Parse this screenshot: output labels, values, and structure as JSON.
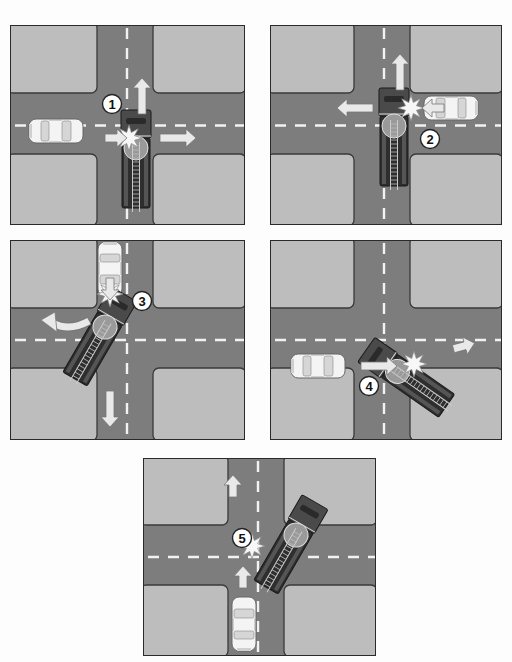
{
  "diagram": {
    "title": "",
    "colors": {
      "road": "#7d7d7d",
      "block": "#bdbdbd",
      "block_border": "#3a3a3a",
      "lane_dash": "#f2f2f2",
      "car_body": "#f4f4f4",
      "truck_body": "#4a4a4a",
      "truck_dark": "#2e2e2e",
      "arrow": "#e9e9e9",
      "impact": "#f7f7f7",
      "label_bg": "#ffffff",
      "label_text": "#111111"
    },
    "panels": [
      {
        "id": 1,
        "label": "1",
        "box": {
          "x": 10,
          "y": 25,
          "w": 235,
          "h": 200
        },
        "road": {
          "vx": 86,
          "vw": 60,
          "hy": 67,
          "hh": 65
        },
        "label_pos": {
          "x": 101,
          "y": 78
        },
        "car": {
          "x": 45,
          "y": 105,
          "angle": 0,
          "desc": "car heading east"
        },
        "truck": {
          "x": 125,
          "y": 130,
          "angle": 0,
          "desc": "fire truck heading north"
        },
        "impact": {
          "x": 118,
          "y": 112
        },
        "arrows": [
          {
            "desc": "truck direction north",
            "x": 131,
            "y": 70,
            "angle": -90
          },
          {
            "desc": "car direction east",
            "x": 105,
            "y": 112,
            "angle": 0,
            "short": true
          },
          {
            "desc": "truck pushed east",
            "x": 167,
            "y": 112,
            "angle": 0
          }
        ]
      },
      {
        "id": 2,
        "label": "2",
        "box": {
          "x": 270,
          "y": 25,
          "w": 232,
          "h": 200
        },
        "road": {
          "vx": 83,
          "vw": 60,
          "hy": 67,
          "hh": 65
        },
        "label_pos": {
          "x": 159,
          "y": 113
        },
        "car": {
          "x": 180,
          "y": 82,
          "angle": 180,
          "desc": "car heading west"
        },
        "truck": {
          "x": 123,
          "y": 108,
          "angle": 0,
          "desc": "fire truck heading north"
        },
        "impact": {
          "x": 140,
          "y": 82
        },
        "arrows": [
          {
            "desc": "truck direction north",
            "x": 129,
            "y": 46,
            "angle": -90
          },
          {
            "desc": "car direction west",
            "x": 162,
            "y": 82,
            "angle": 180,
            "short": true
          },
          {
            "desc": "truck pushed west",
            "x": 84,
            "y": 82,
            "angle": 180
          }
        ]
      },
      {
        "id": 3,
        "label": "3",
        "box": {
          "x": 10,
          "y": 240,
          "w": 235,
          "h": 200
        },
        "road": {
          "vx": 86,
          "vw": 60,
          "hy": 67,
          "hh": 64
        },
        "label_pos": {
          "x": 131,
          "y": 60
        },
        "car": {
          "x": 99,
          "y": 28,
          "angle": 90,
          "desc": "car heading south"
        },
        "truck": {
          "x": 90,
          "y": 93,
          "angle": 30,
          "desc": "fire truck turning northwest"
        },
        "impact": {
          "x": 99,
          "y": 53
        },
        "arrows": [
          {
            "desc": "truck curved northwest",
            "x": 48,
            "y": 85,
            "angle": 200,
            "curved": true
          },
          {
            "desc": "car direction south",
            "x": 99,
            "y": 48,
            "angle": 90,
            "short": true
          },
          {
            "desc": "truck pushed south",
            "x": 99,
            "y": 168,
            "angle": 90
          }
        ]
      },
      {
        "id": 4,
        "label": "4",
        "box": {
          "x": 270,
          "y": 240,
          "w": 232,
          "h": 200
        },
        "road": {
          "vx": 83,
          "vw": 60,
          "hy": 67,
          "hh": 64
        },
        "label_pos": {
          "x": 98,
          "y": 145
        },
        "car": {
          "x": 47,
          "y": 125,
          "angle": 0,
          "desc": "car heading east"
        },
        "truck": {
          "x": 133,
          "y": 135,
          "angle": -55,
          "desc": "fire truck heading northeast"
        },
        "impact": {
          "x": 143,
          "y": 123
        },
        "arrows": [
          {
            "desc": "car direction east",
            "x": 108,
            "y": 125,
            "angle": 0
          },
          {
            "desc": "truck pushed east",
            "x": 193,
            "y": 105,
            "angle": -15,
            "short": true
          }
        ]
      },
      {
        "id": 5,
        "label": "5",
        "box": {
          "x": 143,
          "y": 458,
          "w": 233,
          "h": 198
        },
        "road": {
          "vx": 84,
          "vw": 60,
          "hy": 66,
          "hh": 64
        },
        "label_pos": {
          "x": 98,
          "y": 79
        },
        "car": {
          "x": 100,
          "y": 165,
          "angle": -90,
          "desc": "car heading north"
        },
        "truck": {
          "x": 148,
          "y": 83,
          "angle": 30,
          "desc": "fire truck heading northwest"
        },
        "impact": {
          "x": 108,
          "y": 87
        },
        "arrows": [
          {
            "desc": "truck pushed north",
            "x": 89,
            "y": 27,
            "angle": -90,
            "short": true
          },
          {
            "desc": "car direction north",
            "x": 99,
            "y": 118,
            "angle": -90,
            "short": true
          }
        ]
      }
    ]
  }
}
